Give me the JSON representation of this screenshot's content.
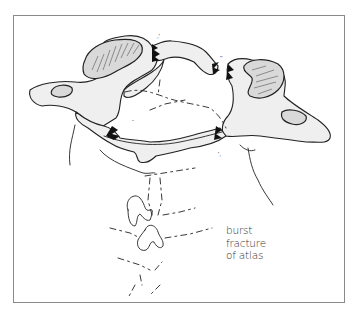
{
  "figure": {
    "caption_lines": [
      "burst",
      "fracture",
      "of atlas"
    ],
    "colors": {
      "bone_fill": "#efefef",
      "facet_fill": "#d9d9d9",
      "ink": "#222222",
      "frame": "#8a8a8a",
      "background": "#ffffff"
    },
    "fracture_sites": [
      "anterior arch left",
      "anterior arch right",
      "posterior arch left",
      "posterior arch right"
    ]
  }
}
